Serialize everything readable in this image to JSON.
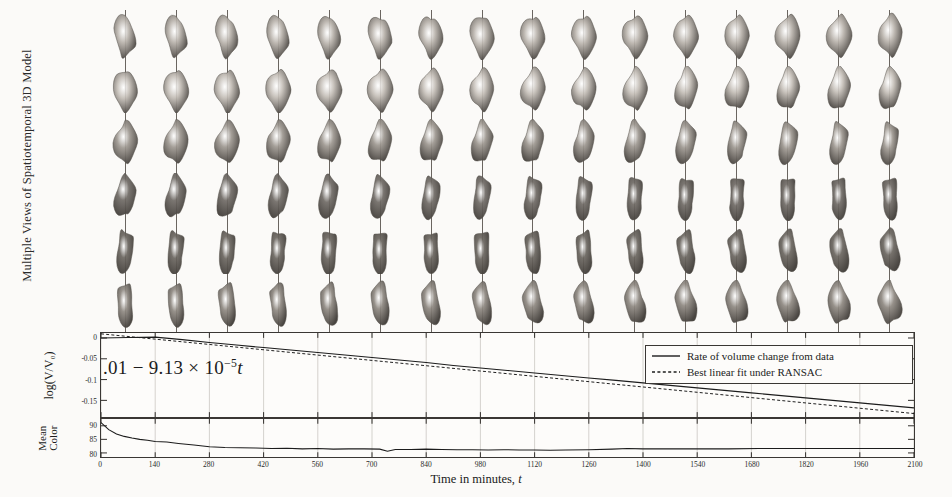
{
  "figure": {
    "models_axis_label": "Multiple Views of Spatiotemporal 3D Model",
    "xlabel_text": "Time in minutes,",
    "xlabel_symbol": "t",
    "equation": {
      "lead": ".01",
      "minus": "−",
      "coefficient": "9.13",
      "times": "×",
      "base": "10",
      "exponent": "−5",
      "variable": "t",
      "full": ".01 − 9.13 × 10−5t"
    }
  },
  "legend": {
    "position": "top-right",
    "entries": [
      {
        "label": "Rate of volume change from data",
        "style": "solid",
        "color": "#1c1c1c"
      },
      {
        "label": "Best linear fit under RANSAC",
        "style": "dashed",
        "color": "#1c1c1c"
      }
    ]
  },
  "model_grid": {
    "columns": 16,
    "rows": 6,
    "row_shades": [
      "#b9b3ac",
      "#c3bdb6",
      "#9d9790",
      "#6f6a65",
      "#6a655f",
      "#8e8881"
    ],
    "row_views": [
      "view-front",
      "view-front-tilt",
      "view-side",
      "view-rear",
      "view-rear-tilt",
      "view-top"
    ]
  },
  "chart_data": [
    {
      "type": "line",
      "name": "volume",
      "title": "",
      "xlabel": "Time in minutes, t",
      "ylabel": "log(V/V₀)",
      "xlim": [
        0,
        2100
      ],
      "ylim": [
        -0.19,
        0.012
      ],
      "yticks": [
        0,
        -0.05,
        -0.1,
        -0.15
      ],
      "ytick_labels": [
        "0",
        "-0.05",
        "-0.1",
        "-0.15"
      ],
      "xticks": [
        0,
        140,
        280,
        420,
        560,
        700,
        840,
        980,
        1120,
        1260,
        1400,
        1540,
        1680,
        1820,
        1960,
        2100
      ],
      "grid": true,
      "series": [
        {
          "name": "Rate of volume change from data",
          "style": "solid",
          "x": [
            0,
            70,
            140,
            210,
            280,
            350,
            420,
            490,
            560,
            630,
            700,
            770,
            840,
            910,
            980,
            1050,
            1120,
            1190,
            1260,
            1330,
            1400,
            1470,
            1540,
            1610,
            1680,
            1750,
            1820,
            1890,
            1960,
            2030,
            2100
          ],
          "y": [
            0.0,
            0.001,
            0.002,
            -0.004,
            -0.011,
            -0.017,
            -0.023,
            -0.029,
            -0.035,
            -0.041,
            -0.047,
            -0.053,
            -0.059,
            -0.066,
            -0.072,
            -0.078,
            -0.084,
            -0.09,
            -0.096,
            -0.102,
            -0.108,
            -0.114,
            -0.12,
            -0.126,
            -0.132,
            -0.138,
            -0.144,
            -0.15,
            -0.156,
            -0.162,
            -0.168
          ]
        },
        {
          "name": "Best linear fit under RANSAC",
          "style": "dashed",
          "x": [
            0,
            2100
          ],
          "y": [
            0.01,
            -0.1817
          ]
        }
      ]
    },
    {
      "type": "line",
      "name": "mean_color",
      "title": "",
      "xlabel": "Time in minutes, t",
      "ylabel": "Mean Color",
      "xlim": [
        0,
        2100
      ],
      "ylim": [
        78.5,
        92.5
      ],
      "yticks": [
        90,
        85,
        80
      ],
      "ytick_labels": [
        "90",
        "85",
        "80"
      ],
      "xticks": [
        0,
        140,
        280,
        420,
        560,
        700,
        840,
        980,
        1120,
        1260,
        1400,
        1540,
        1680,
        1820,
        1960,
        2100
      ],
      "grid": true,
      "series": [
        {
          "name": "Mean color from data",
          "style": "solid",
          "x": [
            0,
            20,
            40,
            60,
            80,
            100,
            120,
            140,
            170,
            200,
            240,
            280,
            320,
            360,
            400,
            440,
            480,
            520,
            560,
            600,
            640,
            680,
            720,
            740,
            760,
            800,
            840,
            880,
            920,
            960,
            1000,
            1040,
            1080,
            1120,
            1160,
            1200,
            1260,
            1320,
            1360,
            1400,
            1460,
            1540,
            1620,
            1700,
            1780,
            1860,
            1960,
            2040,
            2100
          ],
          "y": [
            91.2,
            88.6,
            87.0,
            86.1,
            85.5,
            85.0,
            84.7,
            84.2,
            84.0,
            83.5,
            82.9,
            82.3,
            82.0,
            81.9,
            81.8,
            81.6,
            81.7,
            81.5,
            81.6,
            81.4,
            81.5,
            81.5,
            81.4,
            80.6,
            81.3,
            81.3,
            81.4,
            81.3,
            81.2,
            81.2,
            81.1,
            81.2,
            81.1,
            81.1,
            81.0,
            81.1,
            81.2,
            81.4,
            81.6,
            81.5,
            81.5,
            81.5,
            81.5,
            81.6,
            81.6,
            81.6,
            81.6,
            81.6,
            81.6
          ]
        }
      ]
    }
  ]
}
